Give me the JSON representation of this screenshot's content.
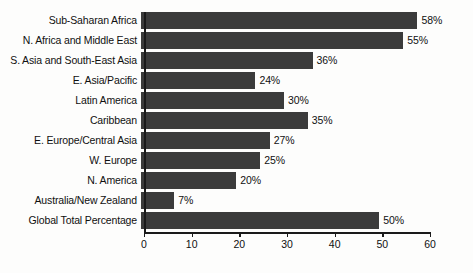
{
  "chart_data": {
    "type": "bar",
    "orientation": "horizontal",
    "title": "",
    "subtitle": "",
    "xlabel": "",
    "ylabel": "",
    "xlim": [
      0,
      60
    ],
    "ylim": null,
    "grid": false,
    "legend": null,
    "legend_position": "none",
    "xticks": [
      0,
      10,
      20,
      30,
      40,
      50,
      60
    ],
    "xtick_labels": [
      "0",
      "10",
      "20",
      "30",
      "40",
      "50",
      "60"
    ],
    "bar_color": "#3b3b3b",
    "background_color": "#fdfdfc",
    "axis_color": "#1a1a1a",
    "value_label_suffix": "%",
    "categories": [
      "Sub-Saharan Africa",
      "N. Africa and Middle East",
      "S. Asia and South-East Asia",
      "E. Asia/Pacific",
      "Latin America",
      "Caribbean",
      "E. Europe/Central Asia",
      "W. Europe",
      "N. America",
      "Australia/New Zealand",
      "Global Total Percentage"
    ],
    "values": [
      58,
      55,
      36,
      24,
      30,
      35,
      27,
      25,
      20,
      7,
      50
    ],
    "value_labels": [
      "58%",
      "55%",
      "36%",
      "24%",
      "30%",
      "35%",
      "27%",
      "25%",
      "20%",
      "7%",
      "50%"
    ],
    "bars": [
      {
        "category": "Sub-Saharan Africa",
        "value": 58,
        "label": "58%"
      },
      {
        "category": "N. Africa and Middle East",
        "value": 55,
        "label": "55%"
      },
      {
        "category": "S. Asia and South-East Asia",
        "value": 36,
        "label": "36%"
      },
      {
        "category": "E. Asia/Pacific",
        "value": 24,
        "label": "24%"
      },
      {
        "category": "Latin America",
        "value": 30,
        "label": "30%"
      },
      {
        "category": "Caribbean",
        "value": 35,
        "label": "35%"
      },
      {
        "category": "E. Europe/Central Asia",
        "value": 27,
        "label": "27%"
      },
      {
        "category": "W. Europe",
        "value": 25,
        "label": "25%"
      },
      {
        "category": "N. America",
        "value": 20,
        "label": "20%"
      },
      {
        "category": "Australia/New Zealand",
        "value": 7,
        "label": "7%"
      },
      {
        "category": "Global Total Percentage",
        "value": 50,
        "label": "50%"
      }
    ]
  }
}
